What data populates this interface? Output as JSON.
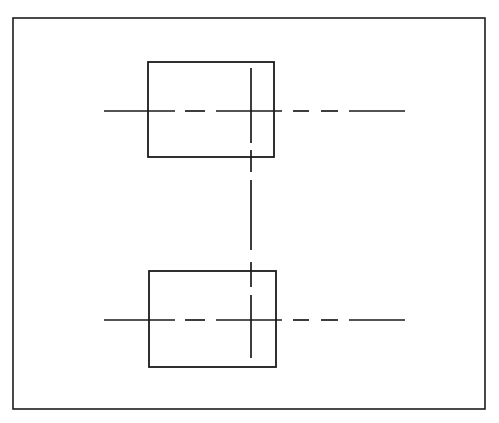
{
  "document": {
    "type": "engineering-drawing",
    "title": "Orthographic Two-View Part Drawing",
    "sheet_width": 499,
    "sheet_height": 423,
    "background_color": "#ffffff",
    "ink_color": "#1a1a1a"
  },
  "frame": {
    "name": "Drawing Sheet Border",
    "x": 13,
    "y": 18,
    "width": 472,
    "height": 391,
    "stroke_width": 1.6,
    "color": "#1d1d1d"
  },
  "views": [
    {
      "id": "upper-view",
      "name": "Upper Rectangular View",
      "x": 148,
      "y": 62,
      "width": 126,
      "height": 95,
      "stroke_width": 1.8,
      "color": "#1a1a1a"
    },
    {
      "id": "lower-view",
      "name": "Lower Rectangular View",
      "x": 149,
      "y": 271,
      "width": 127,
      "height": 96,
      "stroke_width": 1.8,
      "color": "#1a1a1a"
    }
  ],
  "centerlines": {
    "stroke_width": 1.7,
    "color": "#1a1a1a",
    "horizontal": [
      {
        "id": "upper-horizontal-centerline",
        "name": "Upper Horizontal Centerline",
        "y": 111,
        "x_start": 104,
        "x_end": 405,
        "segments": [
          [
            104,
            175
          ],
          [
            185,
            205
          ],
          [
            216,
            282
          ],
          [
            293,
            309
          ],
          [
            321,
            338
          ],
          [
            349,
            405
          ]
        ]
      },
      {
        "id": "lower-horizontal-centerline",
        "name": "Lower Horizontal Centerline",
        "y": 320,
        "x_start": 104,
        "x_end": 405,
        "segments": [
          [
            104,
            175
          ],
          [
            185,
            205
          ],
          [
            216,
            282
          ],
          [
            293,
            309
          ],
          [
            321,
            338
          ],
          [
            349,
            405
          ]
        ]
      }
    ],
    "vertical": [
      {
        "id": "main-vertical-centerline",
        "name": "Main Vertical Centerline",
        "x": 251,
        "y_start": 68,
        "y_end": 358,
        "segments": [
          [
            68,
            143
          ],
          [
            150,
            172
          ],
          [
            180,
            250
          ],
          [
            262,
            287
          ],
          [
            295,
            358
          ]
        ]
      }
    ]
  },
  "artifacts": [
    {
      "id": "scan-mark",
      "name": "Scan Artifact Mark",
      "x": 113,
      "y": 1,
      "width": 2,
      "height": 7
    }
  ],
  "labels": {
    "sheet_label": "",
    "upper_view_label": "",
    "lower_view_label": ""
  }
}
